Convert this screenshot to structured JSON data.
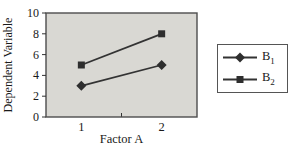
{
  "colors": {
    "line": "#333333",
    "marker": "#2e2e2e",
    "plot_bg": "#d9d8d3",
    "plot_border": "#4d4d4d",
    "tick": "#333333",
    "text": "#1a1a1a",
    "legend_bg": "#ffffff",
    "legend_border": "#555555"
  },
  "chart_data": {
    "type": "line",
    "title": "",
    "xlabel": "Factor A",
    "ylabel": "Dependent Variable",
    "x": [
      1,
      2
    ],
    "xticks": [
      "1",
      "2"
    ],
    "x_minor_ticks": [
      1.5
    ],
    "xlim": [
      0.56,
      2.44
    ],
    "yticks": [
      0,
      2,
      4,
      6,
      8,
      10
    ],
    "ylim": [
      0,
      10
    ],
    "grid": false,
    "legend_position": "right",
    "series": [
      {
        "name": "B1",
        "label_base": "B",
        "label_sub": "1",
        "marker": "diamond",
        "values": [
          3,
          5
        ]
      },
      {
        "name": "B2",
        "label_base": "B",
        "label_sub": "2",
        "marker": "square",
        "values": [
          5,
          8
        ]
      }
    ]
  }
}
